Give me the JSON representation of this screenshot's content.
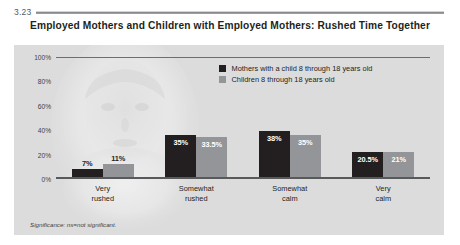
{
  "figure": {
    "number": "3.23",
    "title": "Employed Mothers and Children with Employed Mothers: Rushed Time Together",
    "footnote": "Significance: ns=not significant."
  },
  "colors": {
    "series0": "#231f20",
    "series1": "#939598",
    "panel_background": "#dcdcdc",
    "axis": "#6d6e71"
  },
  "chart_data": {
    "type": "bar",
    "title": "Employed Mothers and Children with Employed Mothers: Rushed Time Together",
    "xlabel": "",
    "ylabel": "",
    "ylim": [
      0,
      100
    ],
    "yticks": [
      "0%",
      "20%",
      "40%",
      "60%",
      "80%",
      "100%"
    ],
    "ytick_values": [
      0,
      20,
      40,
      60,
      80,
      100
    ],
    "grid": false,
    "legend_position": "top-center",
    "categories": [
      "Very\nrushed",
      "Somewhat\nrushed",
      "Somewhat\ncalm",
      "Very\ncalm"
    ],
    "category_lines": [
      [
        "Very",
        "rushed"
      ],
      [
        "Somewhat",
        "rushed"
      ],
      [
        "Somewhat",
        "calm"
      ],
      [
        "Very",
        "calm"
      ]
    ],
    "series": [
      {
        "name": "Mothers with a child 8 through 18 years old",
        "color": "#231f20",
        "values": [
          7,
          35,
          38,
          20.5
        ],
        "labels": [
          "7%",
          "35%",
          "38%",
          "20.5%"
        ]
      },
      {
        "name": "Children 8 through 18 years old",
        "color": "#939598",
        "values": [
          11,
          33.5,
          35,
          21
        ],
        "labels": [
          "11%",
          "33.5%",
          "35%",
          "21%"
        ]
      }
    ],
    "annotations": [
      "Significance: ns=not significant."
    ]
  }
}
